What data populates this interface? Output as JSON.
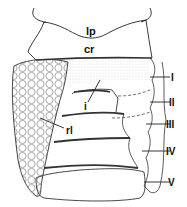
{
  "figure": {
    "type": "anatomical line drawing",
    "labels": {
      "lp": "lp",
      "cr": "cr",
      "i": "i",
      "rl": "rl",
      "seg1": "I",
      "seg2": "II",
      "seg3": "III",
      "seg4": "IV",
      "seg5": "V"
    },
    "colors": {
      "line": "#222222",
      "background": "#ffffff"
    }
  }
}
